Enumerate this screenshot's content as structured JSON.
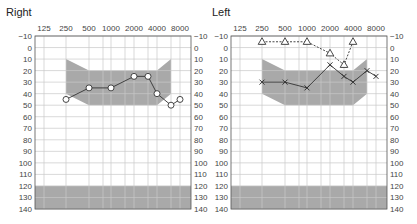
{
  "colors": {
    "shade": "#a9a9a9",
    "grid": "#c8c8c8",
    "frame": "#555555",
    "line": "#333333",
    "label": "#444444"
  },
  "chart_data": [
    {
      "type": "line",
      "title": "Right",
      "xlabel": "Frequency (Hz)",
      "ylabel": "Hearing level (dB)",
      "x_tick_labels": [
        "125",
        "250",
        "500",
        "1000",
        "2000",
        "4000",
        "8000"
      ],
      "y_tick_labels": [
        "-10",
        "0",
        "10",
        "20",
        "30",
        "40",
        "50",
        "60",
        "70",
        "80",
        "90",
        "100",
        "110",
        "120",
        "130",
        "140"
      ],
      "ylim": [
        -10,
        140
      ],
      "y_inverted": true,
      "grid": true,
      "normal_zone": {
        "frequencies": [
          250,
          500,
          4000,
          6000
        ],
        "upper": [
          10,
          20,
          20,
          10
        ],
        "lower": [
          40,
          50,
          50,
          40
        ]
      },
      "out_of_range_band": [
        120,
        140
      ],
      "series": [
        {
          "name": "Air conduction (O)",
          "marker": "circle",
          "line": "solid",
          "x": [
            250,
            500,
            1000,
            2000,
            3000,
            4000,
            6000,
            8000
          ],
          "values": [
            45,
            35,
            35,
            25,
            25,
            40,
            50,
            45
          ]
        }
      ]
    },
    {
      "type": "line",
      "title": "Left",
      "xlabel": "Frequency (Hz)",
      "ylabel": "Hearing level (dB)",
      "x_tick_labels": [
        "125",
        "250",
        "500",
        "1000",
        "2000",
        "4000",
        "8000"
      ],
      "y_tick_labels": [
        "-10",
        "0",
        "10",
        "20",
        "30",
        "40",
        "50",
        "60",
        "70",
        "80",
        "90",
        "100",
        "110",
        "120",
        "130",
        "140"
      ],
      "ylim": [
        -10,
        140
      ],
      "y_inverted": true,
      "grid": true,
      "normal_zone": {
        "frequencies": [
          250,
          500,
          4000,
          6000
        ],
        "upper": [
          10,
          20,
          20,
          10
        ],
        "lower": [
          40,
          50,
          50,
          40
        ]
      },
      "out_of_range_band": [
        120,
        140
      ],
      "series": [
        {
          "name": "Air conduction (X)",
          "marker": "cross",
          "line": "solid",
          "x": [
            250,
            500,
            1000,
            2000,
            3000,
            4000,
            6000,
            8000
          ],
          "values": [
            30,
            30,
            35,
            15,
            25,
            30,
            20,
            25
          ]
        },
        {
          "name": "Triangle",
          "marker": "triangle",
          "line": "dashed",
          "x": [
            250,
            500,
            1000,
            2000,
            3000,
            4000
          ],
          "values": [
            -5,
            -5,
            -5,
            5,
            15,
            -5
          ]
        }
      ]
    }
  ]
}
